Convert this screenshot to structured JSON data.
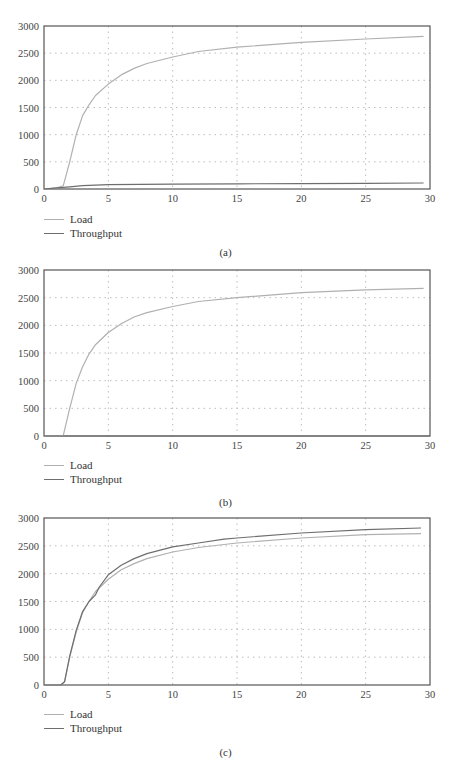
{
  "colors": {
    "load": "#b0b0b0",
    "throughput": "#6e6e6e",
    "axis": "#555555",
    "grid": "#bdbdbd"
  },
  "chart_data": [
    {
      "type": "line",
      "panel": "a",
      "caption": "(a)",
      "xlim": [
        0,
        30
      ],
      "ylim": [
        0,
        3000
      ],
      "xticks": [
        0,
        5,
        10,
        15,
        20,
        25,
        30
      ],
      "yticks": [
        0,
        500,
        1000,
        1500,
        2000,
        2500,
        3000
      ],
      "grid": true,
      "legend_position": "bottom-left",
      "xlabel": "",
      "ylabel": "",
      "series": [
        {
          "name": "Load",
          "x": [
            0,
            1,
            1.5,
            2,
            2.5,
            3,
            3.5,
            4,
            5,
            6,
            7,
            8,
            10,
            12,
            15,
            20,
            25,
            29.5
          ],
          "y": [
            0,
            20,
            60,
            500,
            1000,
            1350,
            1550,
            1720,
            1930,
            2100,
            2220,
            2310,
            2430,
            2530,
            2610,
            2700,
            2760,
            2810
          ]
        },
        {
          "name": "Throughput",
          "x": [
            0,
            1,
            2,
            3,
            5,
            10,
            15,
            20,
            25,
            29.5
          ],
          "y": [
            0,
            20,
            40,
            60,
            80,
            90,
            95,
            100,
            105,
            110
          ]
        }
      ]
    },
    {
      "type": "line",
      "panel": "b",
      "caption": "(b)",
      "xlim": [
        0,
        30
      ],
      "ylim": [
        0,
        3000
      ],
      "xticks": [
        0,
        5,
        10,
        15,
        20,
        25,
        30
      ],
      "yticks": [
        0,
        500,
        1000,
        1500,
        2000,
        2500,
        3000
      ],
      "grid": true,
      "legend_position": "bottom-left",
      "xlabel": "",
      "ylabel": "",
      "series": [
        {
          "name": "Load",
          "x": [
            0,
            1.2,
            1.5,
            2,
            2.5,
            3,
            3.5,
            4,
            5,
            6,
            7,
            8,
            10,
            12,
            15,
            20,
            25,
            29.5
          ],
          "y": [
            0,
            0,
            10,
            500,
            950,
            1250,
            1480,
            1650,
            1870,
            2030,
            2150,
            2230,
            2340,
            2430,
            2500,
            2590,
            2640,
            2670
          ]
        },
        {
          "name": "Throughput",
          "x": [
            0,
            30
          ],
          "y": [
            0,
            0
          ]
        }
      ]
    },
    {
      "type": "line",
      "panel": "c",
      "caption": "(c)",
      "xlim": [
        0,
        30
      ],
      "ylim": [
        0,
        3000
      ],
      "xticks": [
        0,
        5,
        10,
        15,
        20,
        25,
        30
      ],
      "yticks": [
        0,
        500,
        1000,
        1500,
        2000,
        2500,
        3000
      ],
      "grid": true,
      "legend_position": "bottom-left",
      "xlabel": "",
      "ylabel": "",
      "series": [
        {
          "name": "Load",
          "x": [
            0,
            1.3,
            1.6,
            2,
            2.5,
            3,
            3.5,
            4,
            5,
            6,
            7,
            8,
            10,
            12,
            15,
            20,
            25,
            29.3
          ],
          "y": [
            0,
            0,
            60,
            500,
            950,
            1300,
            1500,
            1680,
            1900,
            2070,
            2180,
            2270,
            2390,
            2470,
            2550,
            2640,
            2700,
            2720
          ]
        },
        {
          "name": "Throughput",
          "x": [
            0,
            1.3,
            1.6,
            2,
            2.5,
            3,
            3.5,
            4,
            4.3,
            5,
            6,
            7,
            8,
            10,
            12,
            14,
            15,
            20,
            25,
            29.3
          ],
          "y": [
            0,
            0,
            60,
            520,
            980,
            1320,
            1500,
            1620,
            1760,
            1980,
            2150,
            2270,
            2360,
            2480,
            2550,
            2620,
            2640,
            2730,
            2790,
            2820
          ]
        }
      ]
    }
  ],
  "panels": [
    {
      "caption": "(a)",
      "legend": [
        "Load",
        "Throughput"
      ]
    },
    {
      "caption": "(b)",
      "legend": [
        "Load",
        "Throughput"
      ]
    },
    {
      "caption": "(c)",
      "legend": [
        "Load",
        "Throughput"
      ]
    }
  ]
}
